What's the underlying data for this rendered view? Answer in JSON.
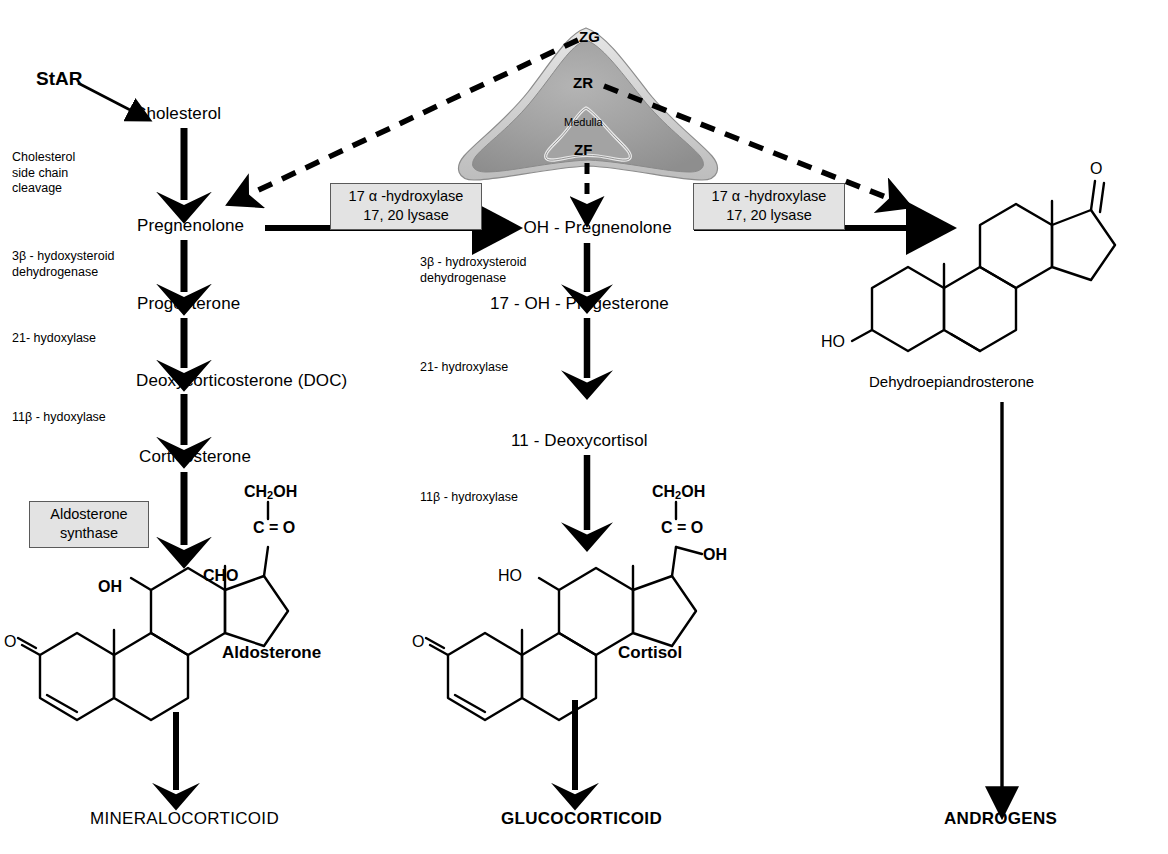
{
  "figure": {
    "source_protein": "StAR",
    "gland": {
      "zones": [
        {
          "id": "ZG",
          "label": "ZG"
        },
        {
          "id": "ZR",
          "label": "ZR"
        },
        {
          "id": "ZF",
          "label": "ZF"
        }
      ],
      "medulla_label": "Medulla",
      "colors": {
        "cortex_fill": "#9e9e9e",
        "capsule_fill": "#d4d4d4",
        "medulla_fill": "#9e9e9e",
        "outline": "#7a7a7a"
      }
    }
  },
  "colors": {
    "line": "#000000",
    "enzyme_box_fill": "#e3e3e3",
    "enzyme_box_border": "#5a5a5a",
    "background": "#ffffff"
  },
  "mineralocorticoid_pathway": {
    "metabolites": [
      {
        "name": "Cholesterol"
      },
      {
        "name": "Pregnenolone"
      },
      {
        "name": "Progesterone"
      },
      {
        "name": "Deoxycorticosterone (DOC)"
      },
      {
        "name": "Corticosterone"
      }
    ],
    "enzymes": [
      {
        "name": "Cholesterol\nside chain\ncleavage"
      },
      {
        "name": "3β - hydoxysteroid\ndehydrogenase"
      },
      {
        "name": "21- hydoxylase"
      },
      {
        "name": "11β - hydoxylase"
      }
    ],
    "boxed_enzyme": "Aldosterone\nsynthase",
    "product": "Aldosterone",
    "output_class": "MINERALOCORTICOID"
  },
  "glucocorticoid_pathway": {
    "metabolites": [
      {
        "name": "17 - OH - Pregnenolone"
      },
      {
        "name": "17 - OH - Progesterone"
      },
      {
        "name": "11 - Deoxycortisol"
      }
    ],
    "enzymes": [
      {
        "name": "3β - hydroxysteroid\ndehydrogenase"
      },
      {
        "name": "21- hydroxylase"
      },
      {
        "name": "11β - hydroxylase"
      }
    ],
    "product": "Cortisol",
    "output_class": "GLUCOCORTICOID"
  },
  "androgen_pathway": {
    "product": "Dehydroepiandrosterone",
    "output_class": "ANDROGENS"
  },
  "boxed_enzymes": [
    {
      "id": "cyp17-left",
      "name": "17 α -hydroxylase\n17, 20 lysase"
    },
    {
      "id": "cyp17-right",
      "name": "17 α -hydroxylase\n17, 20 lysase"
    }
  ],
  "structures": {
    "aldosterone": {
      "name": "Aldosterone",
      "atom_labels": [
        "CH2OH",
        "C = O",
        "CHO",
        "OH",
        "O"
      ]
    },
    "cortisol": {
      "name": "Cortisol",
      "atom_labels": [
        "CH2OH",
        "C = O",
        "OH",
        "HO",
        "O"
      ]
    },
    "dhea": {
      "name": "Dehydroepiandrosterone",
      "atom_labels": [
        "O",
        "HO"
      ]
    }
  }
}
